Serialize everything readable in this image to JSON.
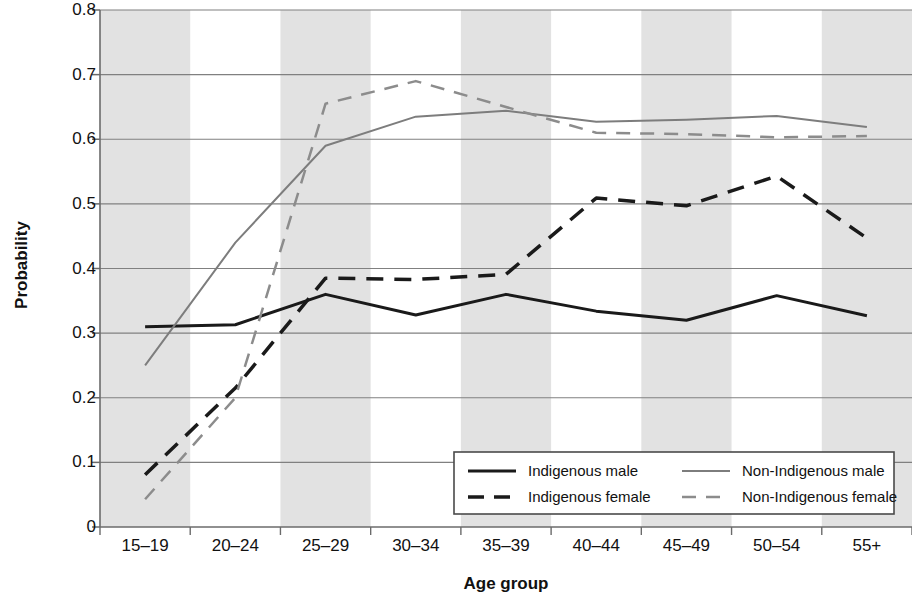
{
  "chart_data": {
    "type": "line",
    "title": "",
    "xlabel": "Age group",
    "ylabel": "Probability",
    "categories": [
      "15–19",
      "20–24",
      "25–29",
      "30–34",
      "35–39",
      "40–44",
      "45–49",
      "50–54",
      "55+"
    ],
    "ylim": [
      0,
      0.8
    ],
    "yticks": [
      "0",
      "0.1",
      "0.2",
      "0.3",
      "0.4",
      "0.5",
      "0.6",
      "0.7",
      "0.8"
    ],
    "ytick_values": [
      0,
      0.1,
      0.2,
      0.3,
      0.4,
      0.5,
      0.6,
      0.7,
      0.8
    ],
    "grid": "horizontal",
    "banding": "alternating vertical gray bands on odd categories",
    "legend_position": "bottom-right inside plot",
    "series": [
      {
        "name": "Indigenous male",
        "style": "solid",
        "color": "#1a1a1a",
        "width": 3,
        "values": [
          0.31,
          0.313,
          0.36,
          0.328,
          0.36,
          0.334,
          0.32,
          0.358,
          0.327
        ]
      },
      {
        "name": "Indigenous female",
        "style": "dashed",
        "color": "#1a1a1a",
        "width": 3.5,
        "values": [
          0.081,
          0.215,
          0.385,
          0.383,
          0.391,
          0.509,
          0.497,
          0.543,
          0.447
        ]
      },
      {
        "name": "Non-Indigenous male",
        "style": "solid",
        "color": "#7d7d7d",
        "width": 2,
        "values": [
          0.25,
          0.44,
          0.59,
          0.635,
          0.644,
          0.627,
          0.63,
          0.636,
          0.619
        ]
      },
      {
        "name": "Non-Indigenous female",
        "style": "dashed",
        "color": "#8c8c8c",
        "width": 2.5,
        "values": [
          0.043,
          0.2,
          0.655,
          0.69,
          0.65,
          0.61,
          0.608,
          0.603,
          0.605
        ]
      }
    ]
  },
  "axes": {
    "ylabel": "Probability",
    "xlabel": "Age group"
  },
  "legend": {
    "entries": [
      {
        "label": "Indigenous male",
        "style": "solid",
        "color": "#1a1a1a"
      },
      {
        "label": "Indigenous female",
        "style": "dashed",
        "color": "#1a1a1a"
      },
      {
        "label": "Non-Indigenous male",
        "style": "solid",
        "color": "#7d7d7d"
      },
      {
        "label": "Non-Indigenous female",
        "style": "dashed",
        "color": "#8c8c8c"
      }
    ]
  },
  "colors": {
    "band": "#e2e2e2",
    "grid": "#808080",
    "axis": "#6b6b6b",
    "text": "#111111",
    "background": "#ffffff"
  }
}
